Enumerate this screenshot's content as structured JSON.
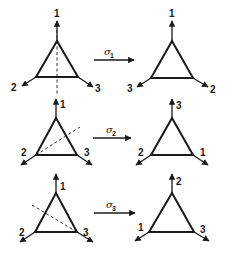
{
  "rows": [
    {
      "operation": {
        "symbol": "σ",
        "subscript": "1"
      },
      "before": {
        "top": "1",
        "left": "2",
        "right": "3",
        "reflection_axis": "vertical through vertex 1"
      },
      "after": {
        "top": "1",
        "left": "3",
        "right": "2"
      }
    },
    {
      "operation": {
        "symbol": "σ",
        "subscript": "2"
      },
      "before": {
        "top": "1",
        "left": "2",
        "right": "3",
        "reflection_axis": "through vertex 2"
      },
      "after": {
        "top": "3",
        "left": "2",
        "right": "1"
      }
    },
    {
      "operation": {
        "symbol": "σ",
        "subscript": "3"
      },
      "before": {
        "top": "1",
        "left": "2",
        "right": "3",
        "reflection_axis": "through vertex 3"
      },
      "after": {
        "top": "2",
        "left": "1",
        "right": "3"
      }
    }
  ],
  "colors": {
    "ink": "#1a1a1a",
    "background": "#ffffff"
  }
}
